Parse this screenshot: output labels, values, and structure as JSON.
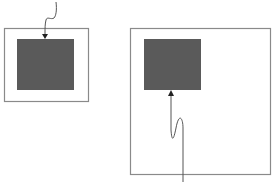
{
  "diagram": {
    "background": "#ffffff",
    "frame_stroke": "#8a8a8a",
    "fill_color": "#5a5a5a",
    "line_color": "#555555",
    "panels": [
      {
        "name": "small-panel",
        "frame": {
          "x": 4.5,
          "y": 28.5,
          "w": 84,
          "h": 73
        },
        "square": {
          "x": 17,
          "y": 39,
          "w": 57,
          "h": 51
        },
        "arrow": {
          "direction": "down",
          "path": "M56,2 C57,10 56,16 54,18 C51,20 47,16 46,20 C45,24 45,28 45,34",
          "head": "42,34 48,34 45,39"
        }
      },
      {
        "name": "large-panel",
        "frame": {
          "x": 130.5,
          "y": 28.5,
          "w": 140,
          "h": 146
        },
        "square": {
          "x": 144,
          "y": 39,
          "w": 57,
          "h": 51
        },
        "arrow": {
          "direction": "up",
          "path": "M183,182 L183,128 C183,118 179,112 176,128 C174,138 172,144 171,130 L171,95",
          "head": "168,96 174,96 171,90"
        }
      }
    ]
  }
}
